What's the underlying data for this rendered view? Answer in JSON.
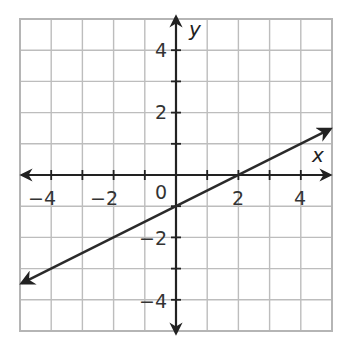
{
  "chart_data": {
    "type": "line",
    "title": "",
    "xlabel": "x",
    "ylabel": "y",
    "xlim": [
      -5,
      5
    ],
    "ylim": [
      -5,
      5
    ],
    "grid": true,
    "grid_step": 1,
    "x_ticks": [
      -4,
      -2,
      2,
      4
    ],
    "y_ticks": [
      -4,
      -2,
      2,
      4
    ],
    "origin_label": "0",
    "series": [
      {
        "name": "line",
        "equation": "y = 0.5x - 1",
        "slope": 0.5,
        "intercept": -1,
        "x": [
          -5,
          5
        ],
        "y": [
          -3.5,
          1.5
        ],
        "arrows": "both",
        "points_on_line": [
          [
            0,
            -1
          ],
          [
            2,
            0
          ],
          [
            -2,
            -2
          ],
          [
            4,
            1
          ]
        ]
      }
    ]
  },
  "labels": {
    "x_axis": "x",
    "y_axis": "y",
    "origin": "0",
    "x_ticks": [
      "−4",
      "−2",
      "2",
      "4"
    ],
    "y_ticks": [
      "4",
      "2",
      "−2",
      "−4"
    ]
  },
  "colors": {
    "grid": "#bdbdbd",
    "axis": "#222222",
    "line": "#2a2a2a"
  }
}
